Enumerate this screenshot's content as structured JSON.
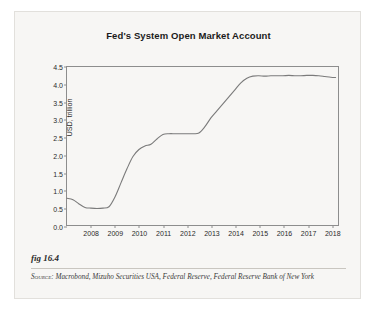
{
  "figure": {
    "number_label": "fig 16.4",
    "source_prefix": "Source:",
    "source_text": "Macrobond, Mizuho Securities USA, Federal Reserve, Federal Reserve Bank of New York"
  },
  "chart_data": {
    "type": "line",
    "title": "Fed's System Open Market Account",
    "xlabel": "",
    "ylabel": "USD, trillion",
    "ylim": [
      0.0,
      4.5
    ],
    "xlim": [
      2007.0,
      2018.3
    ],
    "yticks": [
      "0.0",
      "0.5",
      "1.0",
      "1.5",
      "2.0",
      "2.5",
      "3.0",
      "3.5",
      "4.0",
      "4.5"
    ],
    "ytick_values": [
      0.0,
      0.5,
      1.0,
      1.5,
      2.0,
      2.5,
      3.0,
      3.5,
      4.0,
      4.5
    ],
    "xticks": [
      "2008",
      "2009",
      "2010",
      "2011",
      "2012",
      "2013",
      "2014",
      "2015",
      "2016",
      "2017",
      "2018"
    ],
    "xtick_values": [
      2008,
      2009,
      2010,
      2011,
      2012,
      2013,
      2014,
      2015,
      2016,
      2017,
      2018
    ],
    "grid": false,
    "legend": "none",
    "line_color": "#7b7b7b",
    "series": [
      {
        "name": "System Open Market Account",
        "x": [
          2007.0,
          2007.25,
          2007.5,
          2007.75,
          2008.0,
          2008.25,
          2008.5,
          2008.75,
          2009.0,
          2009.25,
          2009.5,
          2009.75,
          2010.0,
          2010.25,
          2010.5,
          2010.75,
          2011.0,
          2011.25,
          2011.5,
          2011.75,
          2012.0,
          2012.25,
          2012.5,
          2012.75,
          2013.0,
          2013.25,
          2013.5,
          2013.75,
          2014.0,
          2014.25,
          2014.5,
          2014.75,
          2015.0,
          2015.25,
          2015.5,
          2015.75,
          2016.0,
          2016.25,
          2016.5,
          2016.75,
          2017.0,
          2017.25,
          2017.5,
          2017.75,
          2018.0,
          2018.2
        ],
        "values": [
          0.76,
          0.72,
          0.6,
          0.5,
          0.48,
          0.47,
          0.48,
          0.52,
          0.8,
          1.2,
          1.6,
          1.95,
          2.15,
          2.25,
          2.3,
          2.45,
          2.58,
          2.6,
          2.6,
          2.6,
          2.6,
          2.6,
          2.62,
          2.8,
          3.05,
          3.25,
          3.45,
          3.65,
          3.85,
          4.05,
          4.18,
          4.24,
          4.25,
          4.24,
          4.25,
          4.25,
          4.25,
          4.26,
          4.25,
          4.25,
          4.26,
          4.26,
          4.25,
          4.23,
          4.21,
          4.2
        ]
      }
    ]
  }
}
